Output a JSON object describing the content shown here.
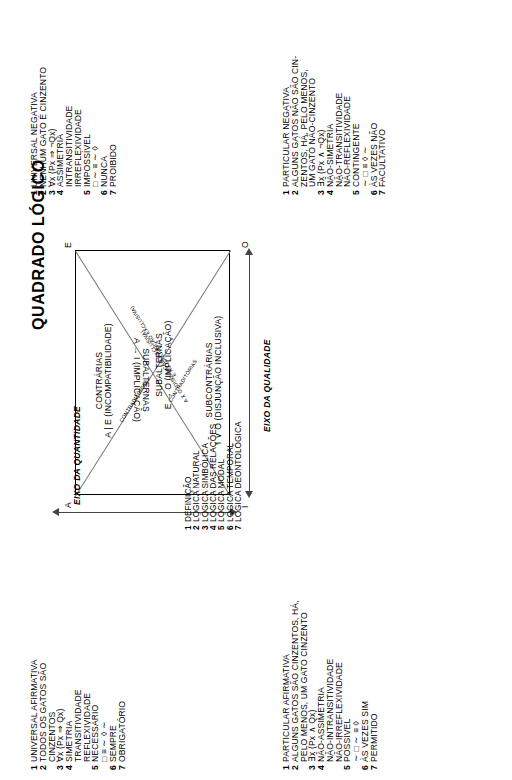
{
  "title": "QUADRADO LÓGICO",
  "square": {
    "corners": {
      "A": "A",
      "E": "E",
      "I": "I",
      "O": "O"
    },
    "top_inner": {
      "line1": "SUBALTERNAS",
      "line2": "E → O (IMPLICAÇÃO)"
    },
    "bottom_inner": {
      "line1": "SUBALTERNAS",
      "line2": "A → I (IMPLICAÇÃO)"
    },
    "left_inner": {
      "line1": "CONTRÁRIAS",
      "line2": "A | E (INCOMPATIBILIDADE)"
    },
    "right_inner": {
      "line1": "SUBCONTRÁRIAS",
      "line2": "I ∨ O (DISJUNÇÃO INCLUSIVA)"
    },
    "diagonal_1": {
      "label": "CONTRADITÓRIAS",
      "formula": "A ⊼ O (DISJUNÇÃO EXCLUSIVA)"
    },
    "diagonal_2": {
      "label": "CONTRADITÓRIAS",
      "formula": "E ⊼ I (DISJUNÇÃO EXCLUSIVA)"
    },
    "axis_quantity": "EIXO DA QUANTIDADE",
    "axis_quality": "EIXO DA QUALIDADE"
  },
  "center_list": [
    {
      "n": "1",
      "text": "DEFINIÇÃO"
    },
    {
      "n": "2",
      "text": "LÓGICA NATURAL"
    },
    {
      "n": "3",
      "text": "LÓGICA SIMBÓLICA"
    },
    {
      "n": "4",
      "text": "LÓGICA DAS RELAÇÕES"
    },
    {
      "n": "5",
      "text": "LÓGICA MODAL"
    },
    {
      "n": "6",
      "text": "LÓGICA TEMPORAL"
    },
    {
      "n": "7",
      "text": "LÓGICA DEONTOLÓGICA"
    }
  ],
  "quadrant_A": {
    "lines": [
      {
        "n": "1",
        "text": "UNIVERSAL AFIRMATIVA"
      },
      {
        "n": "2",
        "text": "TODOS OS GATOS SÃO"
      },
      {
        "n": "",
        "text": "CINZENTOS"
      },
      {
        "n": "3",
        "text": "∀x (Px ⇒ Qx)"
      },
      {
        "n": "4",
        "text": "SIMETRIA"
      },
      {
        "n": "",
        "text": "TRANSITIVIDADE"
      },
      {
        "n": "",
        "text": "REFLEXIVIDADE"
      },
      {
        "n": "5",
        "text": "NECESSÁRIO"
      },
      {
        "n": "",
        "text": "□ ≡ ∼ ◊ ∼"
      },
      {
        "n": "6",
        "text": "SEMPRE"
      },
      {
        "n": "7",
        "text": "OBRIGATÓRIO"
      }
    ]
  },
  "quadrant_E": {
    "lines": [
      {
        "n": "1",
        "text": "UNIVERSAL NEGATIVA"
      },
      {
        "n": "2",
        "text": "NENHUM GATO É CINZENTO"
      },
      {
        "n": "3",
        "text": "∀x (Px ⇒ ¬Qx)"
      },
      {
        "n": "4",
        "text": "ASSIMETRIA"
      },
      {
        "n": "",
        "text": "INTRANSITIVIDADE"
      },
      {
        "n": "",
        "text": "IRREFLEXIVIDADE"
      },
      {
        "n": "5",
        "text": "IMPOSSÍVEL"
      },
      {
        "n": "",
        "text": "□ ∼ ≡ ∼ ◊"
      },
      {
        "n": "6",
        "text": "NUNCA"
      },
      {
        "n": "7",
        "text": "PROIBIDO"
      }
    ]
  },
  "quadrant_I": {
    "lines": [
      {
        "n": "1",
        "text": "PARTICULAR AFIRMATIVA"
      },
      {
        "n": "2",
        "text": "ALGUNS GATOS SÃO CINZENTOS, HÁ,"
      },
      {
        "n": "",
        "text": "PELO MENOS, UM GATO CINZENTO"
      },
      {
        "n": "3",
        "text": "∃x (Px ∧ Qx)"
      },
      {
        "n": "4",
        "text": "NÃO-ASSIMETRIA"
      },
      {
        "n": "",
        "text": "NÃO-INTRANSITIVIDADE"
      },
      {
        "n": "",
        "text": "NÃO-IRREFLEXIVIDADE"
      },
      {
        "n": "5",
        "text": "POSSÍVEL"
      },
      {
        "n": "",
        "text": "∼ □ ∼ ≡ ◊"
      },
      {
        "n": "6",
        "text": "ÀS VEZES SIM"
      },
      {
        "n": "7",
        "text": "PERMITIDO"
      }
    ]
  },
  "quadrant_O": {
    "lines": [
      {
        "n": "1",
        "text": "PARTICULAR NEGATIVA"
      },
      {
        "n": "2",
        "text": "ALGUNS GATOS NÃO SÃO CIN-"
      },
      {
        "n": "",
        "text": "ZENTOS, HÁ, PELO MENOS,"
      },
      {
        "n": "",
        "text": "UM GATO NÃO-CINZENTO"
      },
      {
        "n": "3",
        "text": "∃x (Px ∧ ¬Qx)"
      },
      {
        "n": "4",
        "text": "NÃO-SIMETRIA"
      },
      {
        "n": "",
        "text": "NÃO-TRANSITIVIDADE"
      },
      {
        "n": "",
        "text": "NÃO-REFLEXIVIDADE"
      },
      {
        "n": "5",
        "text": "CONTINGENTE"
      },
      {
        "n": "",
        "text": "∼ □ ≡ ◊ ∼"
      },
      {
        "n": "6",
        "text": "ÀS VEZES NÃO"
      },
      {
        "n": "7",
        "text": "FACULTATIVO"
      }
    ]
  }
}
